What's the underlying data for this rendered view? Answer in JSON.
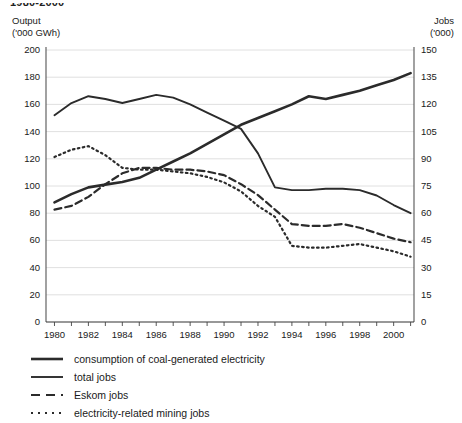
{
  "figure": {
    "title": "1980-2000"
  },
  "axes": {
    "left_caption": "Output\n('000 GWh)",
    "right_caption": "Jobs\n('000)",
    "left_ticks": [
      "200",
      "180",
      "160",
      "140",
      "120",
      "100",
      "80",
      "60",
      "40",
      "20",
      "0"
    ],
    "right_ticks": [
      "150",
      "135",
      "120",
      "105",
      "90",
      "75",
      "60",
      "45",
      "30",
      "15",
      "0"
    ],
    "x_ticks": [
      "1980",
      "1982",
      "1984",
      "1986",
      "1988",
      "1990",
      "1992",
      "1994",
      "1996",
      "1998",
      "2000"
    ]
  },
  "legend": {
    "items": [
      {
        "label": "consumption of coal-generated electricity",
        "style": "solid-thick",
        "icon": "line-solid-thick-icon"
      },
      {
        "label": "total jobs",
        "style": "solid",
        "icon": "line-solid-icon"
      },
      {
        "label": "Eskom jobs",
        "style": "dashed",
        "icon": "line-dashed-icon"
      },
      {
        "label": "electricity-related mining jobs",
        "style": "dotted",
        "icon": "line-dotted-icon"
      }
    ]
  },
  "colors": {
    "line": "#2b2b2b",
    "grid": "#d8d8d8",
    "axis": "#555555",
    "text": "#1a1a1a",
    "background": "#ffffff"
  },
  "chart_data": {
    "type": "line",
    "title": "1980-2000",
    "xlabel": "",
    "ylabel": "Output ('000 GWh)",
    "y2label": "Jobs ('000)",
    "ylim": [
      0,
      200
    ],
    "y2lim": [
      0,
      150
    ],
    "xlim": [
      1979.5,
      2001.2
    ],
    "grid": true,
    "legend_position": "below",
    "x": [
      1980,
      1981,
      1982,
      1983,
      1984,
      1985,
      1986,
      1987,
      1988,
      1989,
      1990,
      1991,
      1992,
      1993,
      1994,
      1995,
      1996,
      1997,
      1998,
      1999,
      2000,
      2001
    ],
    "series": [
      {
        "name": "total jobs",
        "axis": "left",
        "units": "'000 GWh",
        "style": "solid",
        "values": [
          152,
          161,
          166,
          164,
          161,
          164,
          167,
          165,
          160,
          154,
          148,
          142,
          124,
          99,
          97,
          97,
          98,
          98,
          97,
          93,
          86,
          80
        ]
      },
      {
        "name": "consumption of coal-generated electricity",
        "axis": "left",
        "units": "'000 GWh",
        "style": "solid-thick",
        "values": [
          88,
          94,
          99,
          101,
          103,
          106,
          112,
          118,
          124,
          131,
          138,
          145,
          150,
          155,
          160,
          166,
          164,
          167,
          170,
          174,
          178,
          183
        ]
      },
      {
        "name": "electricity-related mining jobs",
        "axis": "right",
        "units": "'000 jobs",
        "style": "dotted",
        "values": [
          91,
          95,
          97,
          92,
          85,
          84,
          84,
          83,
          82,
          80,
          77,
          72,
          64,
          58,
          42,
          41,
          41,
          42,
          43,
          41,
          39,
          36
        ]
      },
      {
        "name": "Eskom jobs",
        "axis": "right",
        "units": "'000 jobs",
        "style": "dashed",
        "values": [
          62,
          64,
          69,
          76,
          82,
          85,
          85,
          84,
          84,
          83,
          81,
          76,
          70,
          62,
          54,
          53,
          53,
          54,
          52,
          49,
          46,
          44
        ]
      }
    ]
  }
}
